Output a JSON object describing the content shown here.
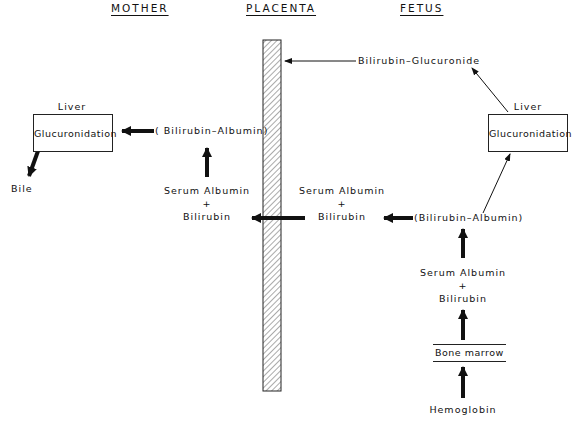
{
  "headers": {
    "mother": "MOTHER",
    "placenta": "PLACENTA",
    "fetus": "FETUS"
  },
  "mother": {
    "liver_label": "Liver",
    "liver_box": "Glucuronidation",
    "bile": "Bile",
    "bilirubin_albumin": "( Bilirubin–Albumin)",
    "serum_albumin": "Serum Albumin",
    "plus": "+",
    "bilirubin": "Bilirubin"
  },
  "fetus": {
    "bilirubin_glucuronide": "Bilirubin–Glucuronide",
    "liver_label": "Liver",
    "liver_box": "Glucuronidation",
    "serum_albumin_transfer": "Serum Albumin",
    "plus_transfer": "+",
    "bilirubin_transfer": "Bilirubin",
    "bilirubin_albumin": "(Bilirubin–Albumin)",
    "serum_albumin": "Serum Albumin",
    "plus": "+",
    "bilirubin": "Bilirubin",
    "bone_marrow": "Bone marrow",
    "hemoglobin": "Hemoglobin"
  },
  "colors": {
    "ink": "#111111",
    "background": "#ffffff"
  }
}
